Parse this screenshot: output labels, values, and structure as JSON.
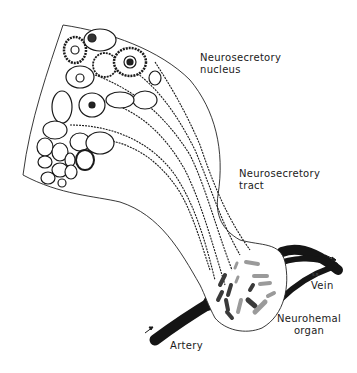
{
  "diagram": {
    "type": "anatomical-illustration",
    "labels": {
      "nucleus_line1": "Neurosecretory",
      "nucleus_line2": "nucleus",
      "tract_line1": "Neurosecretory",
      "tract_line2": "tract",
      "vein": "Vein",
      "organ_line1": "Neurohemal",
      "organ_line2": "organ",
      "artery": "Artery",
      "signature": "S.R."
    },
    "colors": {
      "ink": "#1a1a1a",
      "vessel": "#151515",
      "granule_dark": "#3a3a3a",
      "granule_light": "#9a9a9a",
      "background": "#ffffff"
    },
    "arrows": [
      {
        "name": "artery-flow-arrow",
        "direction": "into organ"
      },
      {
        "name": "vein-flow-arrow",
        "direction": "out of organ"
      }
    ]
  }
}
